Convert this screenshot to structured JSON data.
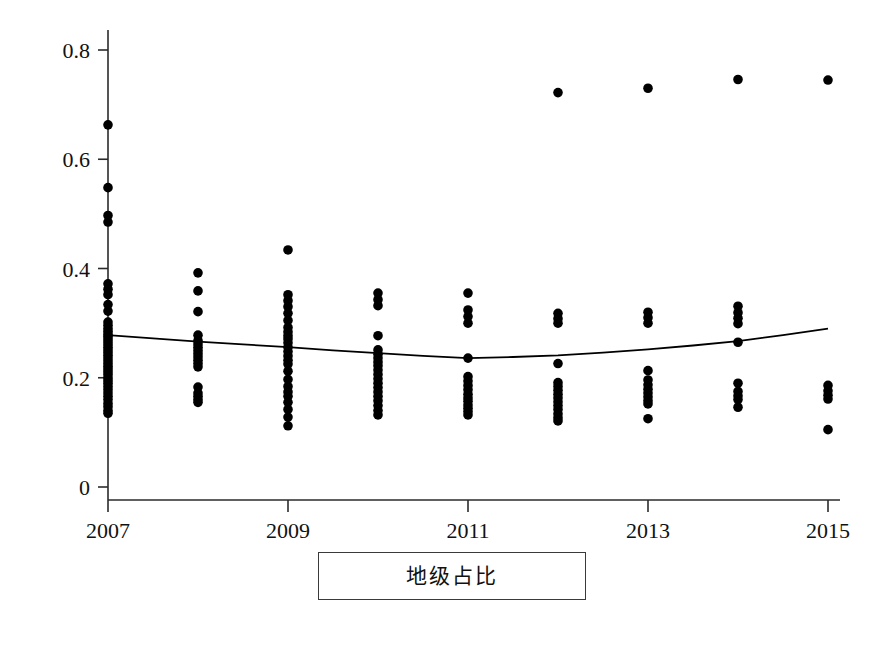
{
  "caption": {
    "text": "地级占比"
  },
  "chart_data": {
    "type": "scatter",
    "title": "",
    "subtitle": "",
    "xlabel": "",
    "ylabel": "",
    "xlim": [
      2006.6,
      2015.6
    ],
    "ylim": [
      0,
      0.85
    ],
    "grid": false,
    "legend": null,
    "x_tick_labels": [
      "2007",
      "2009",
      "2011",
      "2013",
      "2015"
    ],
    "x_tick_values": [
      2007,
      2009,
      2011,
      2013,
      2015
    ],
    "y_tick_labels": [
      "0",
      "0.2",
      "0.4",
      "0.6",
      "0.8"
    ],
    "y_tick_values": [
      0,
      0.2,
      0.4,
      0.6,
      0.8
    ],
    "marker": {
      "shape": "circle",
      "color": "#000000",
      "size": 7
    },
    "trend_line": {
      "name": "fitted trend",
      "color": "#000000",
      "width": 1.8,
      "shape": "u-curve",
      "x": [
        2007,
        2007.5,
        2008,
        2008.5,
        2009,
        2009.5,
        2010,
        2010.5,
        2011,
        2011.5,
        2012,
        2012.5,
        2013,
        2013.5,
        2014,
        2014.5,
        2015
      ],
      "y": [
        0.278,
        0.272,
        0.266,
        0.261,
        0.256,
        0.25,
        0.245,
        0.24,
        0.236,
        0.238,
        0.241,
        0.246,
        0.252,
        0.259,
        0.267,
        0.278,
        0.29
      ]
    },
    "series": [
      {
        "name": "地级占比 observations",
        "points_by_year": [
          {
            "year": 2007,
            "values": [
              0.663,
              0.548,
              0.497,
              0.485,
              0.372,
              0.362,
              0.352,
              0.334,
              0.322,
              0.302,
              0.296,
              0.29,
              0.285,
              0.28,
              0.276,
              0.271,
              0.266,
              0.261,
              0.256,
              0.251,
              0.246,
              0.241,
              0.236,
              0.231,
              0.226,
              0.221,
              0.216,
              0.211,
              0.206,
              0.2,
              0.195,
              0.19,
              0.184,
              0.178,
              0.172,
              0.166,
              0.16,
              0.153,
              0.147,
              0.14,
              0.135
            ]
          },
          {
            "year": 2008,
            "values": [
              0.392,
              0.359,
              0.321,
              0.278,
              0.268,
              0.262,
              0.256,
              0.25,
              0.244,
              0.238,
              0.232,
              0.226,
              0.22,
              0.183,
              0.172,
              0.166,
              0.16,
              0.155
            ]
          },
          {
            "year": 2009,
            "values": [
              0.434,
              0.352,
              0.341,
              0.33,
              0.318,
              0.305,
              0.292,
              0.284,
              0.277,
              0.271,
              0.264,
              0.256,
              0.248,
              0.24,
              0.232,
              0.225,
              0.212,
              0.197,
              0.184,
              0.174,
              0.166,
              0.155,
              0.142,
              0.128,
              0.112
            ]
          },
          {
            "year": 2010,
            "values": [
              0.355,
              0.343,
              0.332,
              0.277,
              0.251,
              0.243,
              0.236,
              0.229,
              0.222,
              0.214,
              0.206,
              0.198,
              0.19,
              0.182,
              0.174,
              0.166,
              0.158,
              0.149,
              0.14,
              0.132
            ]
          },
          {
            "year": 2011,
            "values": [
              0.355,
              0.324,
              0.312,
              0.3,
              0.236,
              0.202,
              0.194,
              0.186,
              0.178,
              0.17,
              0.163,
              0.157,
              0.15,
              0.144,
              0.138,
              0.132
            ]
          },
          {
            "year": 2012,
            "values": [
              0.722,
              0.318,
              0.308,
              0.3,
              0.226,
              0.191,
              0.184,
              0.177,
              0.17,
              0.163,
              0.156,
              0.149,
              0.142,
              0.134,
              0.127,
              0.121
            ]
          },
          {
            "year": 2013,
            "values": [
              0.73,
              0.32,
              0.31,
              0.3,
              0.213,
              0.196,
              0.187,
              0.179,
              0.172,
              0.165,
              0.158,
              0.152,
              0.125
            ]
          },
          {
            "year": 2014,
            "values": [
              0.746,
              0.331,
              0.319,
              0.309,
              0.299,
              0.265,
              0.19,
              0.175,
              0.167,
              0.16,
              0.146
            ]
          },
          {
            "year": 2015,
            "values": [
              0.745,
              0.186,
              0.176,
              0.168,
              0.161,
              0.105
            ]
          }
        ],
        "extra_high_outliers": [
          {
            "year": 2011,
            "value": 0.722
          },
          {
            "year": 2012,
            "value": 0.72
          },
          {
            "year": 2013,
            "value": 0.73
          },
          {
            "year": 2014,
            "value": 0.746
          },
          {
            "year": 2015,
            "value": 0.745
          }
        ]
      }
    ]
  }
}
